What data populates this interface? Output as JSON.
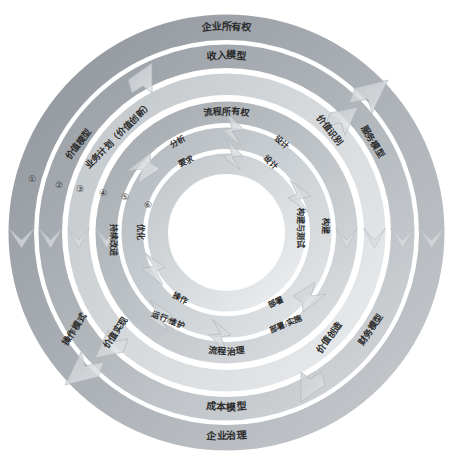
{
  "diagram": {
    "type": "concentric-ring-cycle",
    "title_visible": false,
    "center_empty": true,
    "colors": {
      "ring_dark": "#9aa0a6",
      "ring_mid": "#b9bec3",
      "ring_light": "#d9dde0",
      "ring_pale": "#eceef0",
      "gap_white": "#ffffff",
      "text": "#2b2b2b",
      "arrow_fill": "#c8ccd0",
      "arrow_stroke": "#aeb3b8",
      "background": "#ffffff"
    },
    "numbers": [
      "①",
      "②",
      "③",
      "④",
      "⑤",
      "⑥"
    ],
    "rings": [
      {
        "index": 1,
        "badge": "①",
        "top_label": "企业所有权",
        "bottom_label": "企业治理",
        "right_label": "服务模型",
        "left_label": "操作模式",
        "radius": 205,
        "thickness": 26,
        "shade": "#9aa0a6"
      },
      {
        "index": 2,
        "badge": "②",
        "top_label": "收入模型",
        "bottom_label": "成本模型",
        "right_label": "财务模型",
        "left_label": "价值实现",
        "radius": 176,
        "thickness": 24,
        "shade": "#a6abb0"
      },
      {
        "index": 3,
        "badge": "③",
        "top_label": "业务计划（价值创新）",
        "bottom_label": "价值创造",
        "right_label": "价值创造",
        "left_label": "价值模型",
        "radius": 148,
        "thickness": 22,
        "shade": "#c9ced2"
      },
      {
        "index": 4,
        "badge": "④",
        "top_label": "流程所有权",
        "bottom_label": "流程治理",
        "right_label": "价值识别",
        "left_label": "持续改进",
        "radius": 120,
        "thickness": 22,
        "shade": "#b4b9be"
      },
      {
        "index": 5,
        "badge": "⑤",
        "top_label_left": "分析",
        "top_label_right": "设计",
        "bottom_label_left": "运行/维护",
        "bottom_label_right": "部署/实施",
        "right_label": "构建与测试",
        "left_label": "持续改进",
        "radius": 94,
        "thickness": 22,
        "shade": "#c4c9cd"
      },
      {
        "index": 6,
        "badge": "⑥",
        "top_label_left": "要求",
        "top_label_right": "设计",
        "bottom_label_left": "操作",
        "bottom_label_right": "部署",
        "right_label": "构建",
        "left_label": "优化",
        "radius": 68,
        "thickness": 22,
        "shade": "#d2d6d9"
      }
    ],
    "labels": {
      "enterprise_ownership": "企业所有权",
      "revenue_model": "收入模型",
      "process_ownership": "流程所有权",
      "business_plan": "业务计划（价值创新）",
      "value_model": "价值模型",
      "value_identification": "价值识别",
      "service_model": "服务模型",
      "analysis": "分析",
      "requirements": "要求",
      "design_outer": "设计",
      "design_inner": "设计",
      "build_and_test": "构建与测试",
      "build": "构建",
      "continuous_improvement": "持续改进",
      "optimize": "优化",
      "operate": "操作",
      "run_maintain": "运行/维护",
      "deploy": "部署",
      "deploy_implement": "部署/实施",
      "process_governance": "流程治理",
      "value_creation": "价值创造",
      "financial_model": "财务模型",
      "value_realization": "价值实现",
      "operating_model": "操作模式",
      "cost_model": "成本模型",
      "enterprise_governance": "企业治理"
    }
  }
}
